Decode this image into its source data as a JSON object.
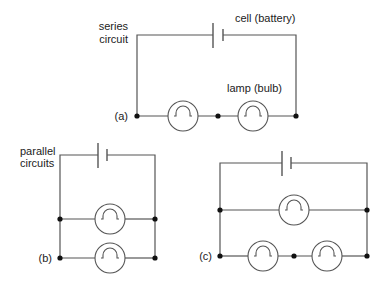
{
  "diagram": {
    "type": "circuit-diagrams",
    "colors": {
      "wire": "#555555",
      "node": "#111111",
      "text": "#222222",
      "background": "#ffffff"
    },
    "labels": {
      "series_line1": "series",
      "series_line2": "circuit",
      "cell": "cell (battery)",
      "lamp": "lamp (bulb)",
      "a": "(a)",
      "parallel_line1": "parallel",
      "parallel_line2": "circuits",
      "b": "(b)",
      "c": "(c)"
    },
    "circuits": [
      {
        "id": "a",
        "kind": "series",
        "cells": 1,
        "lamps": 2
      },
      {
        "id": "b",
        "kind": "parallel",
        "cells": 1,
        "lamps": 2,
        "branches": 2
      },
      {
        "id": "c",
        "kind": "parallel-series",
        "cells": 1,
        "lamps": 3,
        "branches": 2
      }
    ]
  }
}
